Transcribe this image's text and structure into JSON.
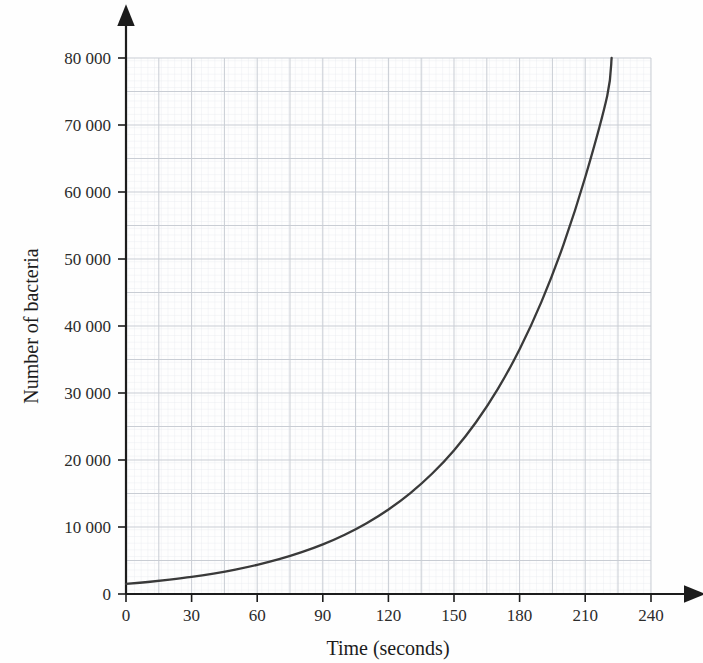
{
  "chart_data": {
    "type": "line",
    "title": "",
    "xlabel": "Time (seconds)",
    "ylabel": "Number of bacteria",
    "xlim": [
      0,
      240
    ],
    "ylim": [
      0,
      80000
    ],
    "x_ticks": [
      0,
      30,
      60,
      90,
      120,
      150,
      180,
      210,
      240
    ],
    "x_tick_labels": [
      "0",
      "30",
      "60",
      "90",
      "120",
      "150",
      "180",
      "210",
      "240"
    ],
    "y_ticks": [
      0,
      10000,
      20000,
      30000,
      40000,
      50000,
      60000,
      70000,
      80000
    ],
    "y_tick_labels": [
      "0",
      "10 000",
      "20 000",
      "30 000",
      "40 000",
      "50 000",
      "60 000",
      "70 000",
      "80 000"
    ],
    "grid": true,
    "grid_major_x_step": 30,
    "grid_major_y_step": 5000,
    "grid_minor_x_step": 6,
    "grid_minor_y_step": 1000,
    "legend": null,
    "series": [
      {
        "name": "Number of bacteria",
        "color": "#3a3a3a",
        "x": [
          0,
          10,
          20,
          30,
          40,
          50,
          60,
          70,
          80,
          90,
          100,
          110,
          120,
          130,
          140,
          150,
          160,
          170,
          180,
          190,
          200,
          210,
          220,
          222
        ],
        "y": [
          1500,
          1790,
          2140,
          2550,
          3050,
          3640,
          4350,
          5190,
          6200,
          7400,
          8840,
          10560,
          12610,
          15060,
          17980,
          21470,
          25640,
          30620,
          36570,
          43670,
          52150,
          62270,
          74360,
          80000
        ]
      }
    ],
    "annotations": []
  },
  "axes": {
    "x_axis_name": "time-axis",
    "y_axis_name": "bacteria-axis",
    "x_arrow": true,
    "y_arrow": true
  },
  "colors": {
    "curve": "#3a3a3a",
    "axis": "#1c1c1c",
    "grid_major": "#c9cdd4",
    "grid_minor": "#e6e9ee",
    "background": "#fefefe",
    "text": "#2b2b2b"
  }
}
